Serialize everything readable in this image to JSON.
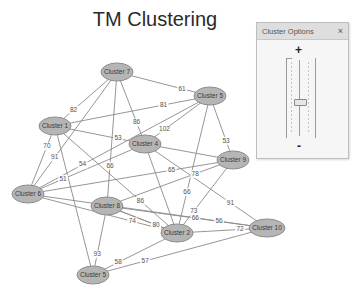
{
  "title": "TM Clustering",
  "panel": {
    "title": "Cluster Options",
    "close_label": "×",
    "plus_label": "+",
    "minus_label": "-",
    "slider_value_fraction": 0.45
  },
  "colors": {
    "node_fill": "#b5b5b5",
    "edge": "#8a8a8a"
  },
  "graph": {
    "nodes": [
      {
        "id": "c7",
        "label": "Cluster 7"
      },
      {
        "id": "c5a",
        "label": "Cluster 5"
      },
      {
        "id": "c1",
        "label": "Cluster 1"
      },
      {
        "id": "c4",
        "label": "Cluster 4"
      },
      {
        "id": "c9",
        "label": "Cluster 9"
      },
      {
        "id": "c6",
        "label": "Cluster 6"
      },
      {
        "id": "c8",
        "label": "Cluster 8"
      },
      {
        "id": "c2",
        "label": "Cluster 2"
      },
      {
        "id": "c10",
        "label": "Cluster 10"
      },
      {
        "id": "c5b",
        "label": "Cluster 5"
      }
    ],
    "edges": [
      {
        "from": "c7",
        "to": "c5a",
        "label": "61"
      },
      {
        "from": "c7",
        "to": "c1",
        "label": "82"
      },
      {
        "from": "c7",
        "to": "c6",
        "label": "91"
      },
      {
        "from": "c7",
        "to": "c8",
        "label": "66"
      },
      {
        "from": "c7",
        "to": "c4",
        "label": "86"
      },
      {
        "from": "c1",
        "to": "c5a",
        "label": "81"
      },
      {
        "from": "c1",
        "to": "c4",
        "label": "53"
      },
      {
        "from": "c1",
        "to": "c2",
        "label": "86"
      },
      {
        "from": "c1",
        "to": "c5b",
        "label": ""
      },
      {
        "from": "c5a",
        "to": "c6",
        "label": "54"
      },
      {
        "from": "c5a",
        "to": "c4",
        "label": "102"
      },
      {
        "from": "c5a",
        "to": "c9",
        "label": "53"
      },
      {
        "from": "c5a",
        "to": "c2",
        "label": "66"
      },
      {
        "from": "c4",
        "to": "c9",
        "label": ""
      },
      {
        "from": "c4",
        "to": "c6",
        "label": "51"
      },
      {
        "from": "c4",
        "to": "c10",
        "label": "91"
      },
      {
        "from": "c4",
        "to": "c2",
        "label": ""
      },
      {
        "from": "c6",
        "to": "c1",
        "label": "70"
      },
      {
        "from": "c6",
        "to": "c9",
        "label": "65"
      },
      {
        "from": "c6",
        "to": "c2",
        "label": "74"
      },
      {
        "from": "c8",
        "to": "c9",
        "label": "78"
      },
      {
        "from": "c8",
        "to": "c10",
        "label": "56"
      },
      {
        "from": "c8",
        "to": "c2",
        "label": "91"
      },
      {
        "from": "c8",
        "to": "c5b",
        "label": "93"
      },
      {
        "from": "c9",
        "to": "c2",
        "label": "73"
      },
      {
        "from": "c2",
        "to": "c10",
        "label": "72"
      },
      {
        "from": "c2",
        "to": "c5b",
        "label": "58"
      },
      {
        "from": "c10",
        "to": "c5b",
        "label": "57"
      },
      {
        "from": "c6",
        "to": "c10",
        "label": "66"
      },
      {
        "from": "c8",
        "to": "c2",
        "label": "80"
      }
    ]
  }
}
